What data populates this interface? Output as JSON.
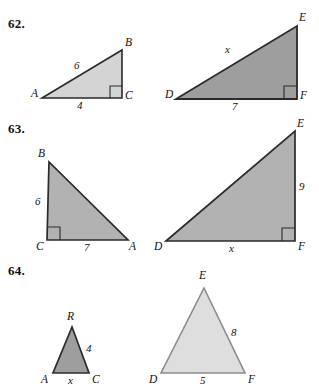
{
  "page": {
    "background_color": "#ffffff",
    "text_color": "#111111"
  },
  "problems": [
    {
      "id": "62",
      "number_label": "62.",
      "figures": [
        {
          "id": "62-left",
          "name": "triangle-abc",
          "shape": "right-triangle",
          "fill_color": "#d4d4d4",
          "stroke_color": "#2b2b2b",
          "right_angle_at": "C",
          "vertices": [
            {
              "label": "A",
              "x": 42,
              "y": 98
            },
            {
              "label": "B",
              "x": 122,
              "y": 50
            },
            {
              "label": "C",
              "x": 122,
              "y": 98
            }
          ],
          "vertex_labels": [
            {
              "label": "A",
              "left": 31,
              "top": 88
            },
            {
              "label": "B",
              "left": 125,
              "top": 37
            },
            {
              "label": "C",
              "left": 125,
              "top": 90
            }
          ],
          "measures": [
            {
              "label": "6",
              "side": "AB",
              "left": 74,
              "top": 60
            },
            {
              "label": "4",
              "side": "AC",
              "left": 77,
              "top": 100
            }
          ]
        },
        {
          "id": "62-right",
          "name": "triangle-def",
          "shape": "right-triangle",
          "fill_color": "#9e9e9e",
          "stroke_color": "#2b2b2b",
          "right_angle_at": "F",
          "vertices": [
            {
              "label": "D",
              "x": 176,
              "y": 99
            },
            {
              "label": "E",
              "x": 297,
              "y": 26
            },
            {
              "label": "F",
              "x": 297,
              "y": 99
            }
          ],
          "vertex_labels": [
            {
              "label": "D",
              "left": 165,
              "top": 89
            },
            {
              "label": "E",
              "left": 299,
              "top": 12
            },
            {
              "label": "F",
              "left": 300,
              "top": 90
            }
          ],
          "measures": [
            {
              "label": "x",
              "side": "DE",
              "left": 225,
              "top": 44
            },
            {
              "label": "7",
              "side": "DF",
              "left": 232,
              "top": 101
            }
          ]
        }
      ]
    },
    {
      "id": "63",
      "number_label": "63.",
      "figures": [
        {
          "id": "63-left",
          "name": "triangle-bca",
          "shape": "right-triangle",
          "fill_color": "#b2b2b2",
          "stroke_color": "#2b2b2b",
          "right_angle_at": "C",
          "vertices": [
            {
              "label": "B",
              "x": 49,
              "y": 47
            },
            {
              "label": "C",
              "x": 47,
              "y": 125
            },
            {
              "label": "A",
              "x": 128,
              "y": 125
            }
          ],
          "vertex_labels": [
            {
              "label": "B",
              "left": 38,
              "top": 33
            },
            {
              "label": "C",
              "left": 36,
              "top": 126
            },
            {
              "label": "A",
              "left": 129,
              "top": 126
            }
          ],
          "measures": [
            {
              "label": "6",
              "side": "BC",
              "left": 35,
              "top": 81
            },
            {
              "label": "7",
              "side": "CA",
              "left": 84,
              "top": 127
            }
          ]
        },
        {
          "id": "63-right",
          "name": "triangle-def",
          "shape": "right-triangle",
          "fill_color": "#b2b2b2",
          "stroke_color": "#2b2b2b",
          "right_angle_at": "F",
          "vertices": [
            {
              "label": "D",
              "x": 166,
              "y": 126
            },
            {
              "label": "E",
              "x": 295,
              "y": 16
            },
            {
              "label": "F",
              "x": 295,
              "y": 126
            }
          ],
          "vertex_labels": [
            {
              "label": "D",
              "left": 154,
              "top": 126
            },
            {
              "label": "E",
              "left": 297,
              "top": 3
            },
            {
              "label": "F",
              "left": 298,
              "top": 126
            }
          ],
          "measures": [
            {
              "label": "9",
              "side": "EF",
              "left": 299,
              "top": 66
            },
            {
              "label": "x",
              "side": "DF",
              "left": 229,
              "top": 128
            }
          ]
        }
      ]
    },
    {
      "id": "64",
      "number_label": "64.",
      "figures": [
        {
          "id": "64-left",
          "name": "triangle-arc",
          "shape": "isosceles-triangle",
          "fill_color": "#9e9e9e",
          "stroke_color": "#2b2b2b",
          "right_angle_at": null,
          "vertices": [
            {
              "label": "R",
              "x": 72,
              "y": 72
            },
            {
              "label": "C",
              "x": 89,
              "y": 118
            },
            {
              "label": "A",
              "x": 53,
              "y": 118
            }
          ],
          "vertex_labels": [
            {
              "label": "R",
              "left": 67,
              "top": 56
            },
            {
              "label": "A",
              "left": 41,
              "top": 119
            },
            {
              "label": "C",
              "left": 92,
              "top": 119
            }
          ],
          "measures": [
            {
              "label": "4",
              "side": "RC",
              "left": 86,
              "top": 88
            },
            {
              "label": "x",
              "side": "AC",
              "left": 68,
              "top": 120
            }
          ]
        },
        {
          "id": "64-right",
          "name": "triangle-def",
          "shape": "isosceles-triangle",
          "fill_color": "#dedede",
          "stroke_color": "#8c8c8c",
          "right_angle_at": null,
          "vertices": [
            {
              "label": "E",
              "x": 204,
              "y": 33
            },
            {
              "label": "F",
              "x": 245,
              "y": 118
            },
            {
              "label": "D",
              "x": 161,
              "y": 118
            }
          ],
          "vertex_labels": [
            {
              "label": "E",
              "left": 199,
              "top": 15
            },
            {
              "label": "D",
              "left": 149,
              "top": 119
            },
            {
              "label": "F",
              "left": 248,
              "top": 119
            }
          ],
          "measures": [
            {
              "label": "8",
              "side": "EF",
              "left": 231,
              "top": 72
            },
            {
              "label": "5",
              "side": "DF",
              "left": 200,
              "top": 120
            }
          ]
        }
      ]
    }
  ]
}
